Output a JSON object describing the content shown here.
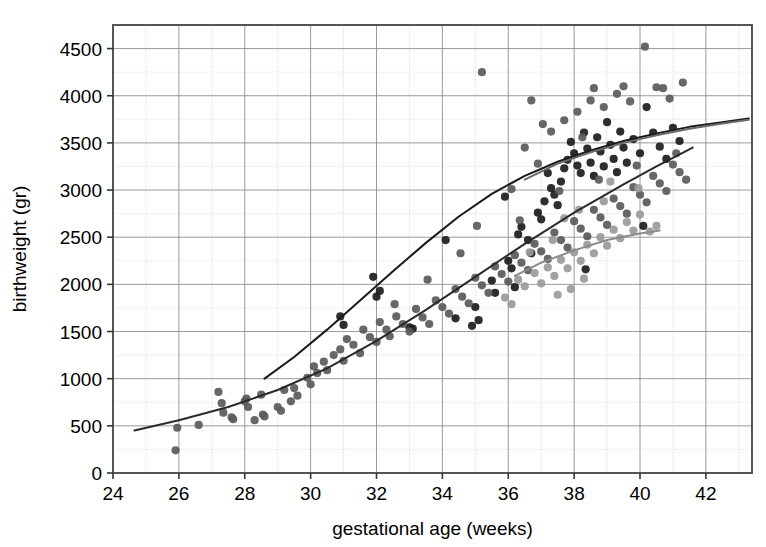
{
  "chart_data": {
    "type": "scatter",
    "title": "",
    "xlabel": "gestational age (weeks)",
    "ylabel": "birthweight (gr)",
    "xlim": [
      24,
      43.4
    ],
    "ylim": [
      0,
      4750
    ],
    "xticks": [
      24,
      26,
      28,
      30,
      32,
      34,
      36,
      38,
      40,
      42
    ],
    "yticks": [
      0,
      500,
      1000,
      1500,
      2000,
      2500,
      3000,
      3500,
      4000,
      4500
    ],
    "x_minor_step": 1,
    "grid": true,
    "grid_color": "#8a8a8a",
    "legend": "none",
    "frame_color": "#555555",
    "series": [
      {
        "name": "dark-points",
        "color": "#1c1c1c",
        "marker": "circle",
        "points": [
          [
            31.9,
            2080
          ],
          [
            32.0,
            1870
          ],
          [
            32.1,
            1930
          ],
          [
            33.1,
            1530
          ],
          [
            33.0,
            1545
          ],
          [
            34.1,
            2470
          ],
          [
            34.9,
            1560
          ],
          [
            35.0,
            1760
          ],
          [
            35.1,
            1620
          ],
          [
            35.5,
            2040
          ],
          [
            35.6,
            1910
          ],
          [
            35.9,
            2930
          ],
          [
            36.0,
            2250
          ],
          [
            36.1,
            2170
          ],
          [
            36.3,
            2530
          ],
          [
            36.4,
            2610
          ],
          [
            36.6,
            2470
          ],
          [
            36.7,
            2330
          ],
          [
            36.9,
            2760
          ],
          [
            37.0,
            2690
          ],
          [
            37.1,
            2880
          ],
          [
            37.2,
            3180
          ],
          [
            37.3,
            3020
          ],
          [
            37.4,
            2950
          ],
          [
            37.5,
            2840
          ],
          [
            37.6,
            3090
          ],
          [
            37.7,
            3230
          ],
          [
            37.8,
            3320
          ],
          [
            37.9,
            3510
          ],
          [
            38.0,
            3390
          ],
          [
            38.1,
            3260
          ],
          [
            38.2,
            3180
          ],
          [
            38.3,
            3610
          ],
          [
            38.4,
            3440
          ],
          [
            38.5,
            3290
          ],
          [
            38.6,
            3150
          ],
          [
            38.7,
            3560
          ],
          [
            38.8,
            3410
          ],
          [
            38.9,
            3250
          ],
          [
            39.0,
            3720
          ],
          [
            39.1,
            3480
          ],
          [
            39.2,
            3330
          ],
          [
            39.3,
            3190
          ],
          [
            39.4,
            3620
          ],
          [
            39.5,
            3450
          ],
          [
            39.6,
            3290
          ],
          [
            39.8,
            3540
          ],
          [
            40.0,
            3390
          ],
          [
            40.2,
            3880
          ],
          [
            40.4,
            3610
          ],
          [
            40.6,
            3460
          ],
          [
            40.8,
            3330
          ],
          [
            41.0,
            3660
          ],
          [
            41.2,
            3520
          ],
          [
            30.9,
            1660
          ],
          [
            31.0,
            1570
          ],
          [
            34.4,
            1640
          ],
          [
            36.2,
            1970
          ],
          [
            38.35,
            2160
          ],
          [
            40.1,
            2620
          ]
        ]
      },
      {
        "name": "medium-gray-points",
        "color": "#5a5a5a",
        "marker": "circle",
        "points": [
          [
            25.9,
            240
          ],
          [
            25.95,
            480
          ],
          [
            26.6,
            510
          ],
          [
            27.2,
            860
          ],
          [
            27.3,
            740
          ],
          [
            27.35,
            640
          ],
          [
            27.6,
            590
          ],
          [
            27.65,
            570
          ],
          [
            28.0,
            760
          ],
          [
            28.05,
            790
          ],
          [
            28.1,
            700
          ],
          [
            28.3,
            560
          ],
          [
            28.5,
            830
          ],
          [
            28.55,
            620
          ],
          [
            28.6,
            600
          ],
          [
            29.0,
            700
          ],
          [
            29.1,
            660
          ],
          [
            29.2,
            880
          ],
          [
            29.4,
            760
          ],
          [
            29.5,
            900
          ],
          [
            29.6,
            820
          ],
          [
            29.9,
            1010
          ],
          [
            30.0,
            940
          ],
          [
            30.1,
            1130
          ],
          [
            30.2,
            1060
          ],
          [
            30.4,
            1180
          ],
          [
            30.5,
            1090
          ],
          [
            30.7,
            1250
          ],
          [
            30.9,
            1310
          ],
          [
            31.0,
            1190
          ],
          [
            31.1,
            1420
          ],
          [
            31.3,
            1360
          ],
          [
            31.5,
            1270
          ],
          [
            31.6,
            1520
          ],
          [
            31.8,
            1440
          ],
          [
            32.0,
            1390
          ],
          [
            32.1,
            1600
          ],
          [
            32.3,
            1520
          ],
          [
            32.4,
            1450
          ],
          [
            32.6,
            1660
          ],
          [
            32.8,
            1580
          ],
          [
            33.0,
            1500
          ],
          [
            33.2,
            1740
          ],
          [
            33.4,
            1650
          ],
          [
            33.6,
            1580
          ],
          [
            33.8,
            1830
          ],
          [
            34.0,
            1760
          ],
          [
            34.2,
            1690
          ],
          [
            34.4,
            1950
          ],
          [
            34.6,
            1870
          ],
          [
            34.8,
            1800
          ],
          [
            35.0,
            2070
          ],
          [
            35.2,
            1990
          ],
          [
            35.4,
            1910
          ],
          [
            35.6,
            2190
          ],
          [
            35.8,
            2110
          ],
          [
            36.0,
            2030
          ],
          [
            36.2,
            2310
          ],
          [
            36.4,
            2230
          ],
          [
            36.6,
            2150
          ],
          [
            36.8,
            2430
          ],
          [
            37.0,
            2350
          ],
          [
            37.2,
            2270
          ],
          [
            37.4,
            2550
          ],
          [
            37.6,
            2470
          ],
          [
            37.8,
            2390
          ],
          [
            38.0,
            2670
          ],
          [
            38.2,
            2590
          ],
          [
            38.4,
            2510
          ],
          [
            38.6,
            2790
          ],
          [
            38.8,
            2710
          ],
          [
            39.0,
            2630
          ],
          [
            39.2,
            2910
          ],
          [
            39.4,
            2830
          ],
          [
            39.6,
            2750
          ],
          [
            39.8,
            3030
          ],
          [
            40.0,
            2950
          ],
          [
            40.2,
            2870
          ],
          [
            40.4,
            3150
          ],
          [
            40.6,
            3070
          ],
          [
            40.8,
            2990
          ],
          [
            41.0,
            3270
          ],
          [
            41.2,
            3190
          ],
          [
            41.4,
            3110
          ],
          [
            36.1,
            3010
          ],
          [
            36.5,
            3450
          ],
          [
            36.9,
            3280
          ],
          [
            37.3,
            3620
          ],
          [
            37.7,
            3740
          ],
          [
            38.1,
            3830
          ],
          [
            38.5,
            3950
          ],
          [
            38.9,
            3880
          ],
          [
            39.3,
            4020
          ],
          [
            39.7,
            3940
          ],
          [
            40.15,
            4520
          ],
          [
            40.5,
            4090
          ],
          [
            40.9,
            3970
          ],
          [
            41.3,
            4140
          ],
          [
            35.2,
            4250
          ],
          [
            36.7,
            3950
          ],
          [
            38.6,
            4080
          ],
          [
            39.5,
            4100
          ],
          [
            40.7,
            4080
          ],
          [
            37.05,
            3700
          ],
          [
            38.25,
            3560
          ],
          [
            36.35,
            2680
          ],
          [
            37.55,
            2990
          ],
          [
            38.75,
            3110
          ],
          [
            39.9,
            3260
          ],
          [
            41.1,
            3390
          ],
          [
            35.05,
            2620
          ],
          [
            34.55,
            2330
          ],
          [
            33.55,
            2050
          ],
          [
            32.55,
            1790
          ]
        ]
      },
      {
        "name": "light-gray-points",
        "color": "#9a9a9a",
        "marker": "circle",
        "points": [
          [
            36.3,
            2050
          ],
          [
            36.5,
            1980
          ],
          [
            36.8,
            2120
          ],
          [
            37.0,
            2010
          ],
          [
            37.2,
            2180
          ],
          [
            37.4,
            2090
          ],
          [
            37.5,
            1890
          ],
          [
            37.6,
            2260
          ],
          [
            37.8,
            2170
          ],
          [
            37.9,
            1950
          ],
          [
            38.0,
            2340
          ],
          [
            38.2,
            2250
          ],
          [
            38.3,
            2060
          ],
          [
            38.4,
            2420
          ],
          [
            38.6,
            2330
          ],
          [
            38.8,
            2500
          ],
          [
            39.0,
            2410
          ],
          [
            39.2,
            2580
          ],
          [
            39.4,
            2490
          ],
          [
            39.6,
            2660
          ],
          [
            39.8,
            2570
          ],
          [
            40.0,
            2740
          ],
          [
            35.9,
            1860
          ],
          [
            36.1,
            1790
          ],
          [
            37.7,
            2700
          ],
          [
            38.9,
            2880
          ],
          [
            39.1,
            3090
          ],
          [
            40.3,
            2560
          ],
          [
            40.5,
            2620
          ],
          [
            37.35,
            2470
          ],
          [
            38.15,
            2790
          ],
          [
            36.65,
            2340
          ],
          [
            39.95,
            3020
          ]
        ]
      }
    ],
    "curves": [
      {
        "name": "upper-curve-dark",
        "color": "#1a1a1a",
        "x_start": 28.6,
        "x_end": 43.3,
        "points": [
          [
            28.6,
            1000
          ],
          [
            29.5,
            1230
          ],
          [
            30.5,
            1520
          ],
          [
            31.5,
            1830
          ],
          [
            32.5,
            2140
          ],
          [
            33.5,
            2440
          ],
          [
            34.5,
            2720
          ],
          [
            35.5,
            2960
          ],
          [
            36.5,
            3150
          ],
          [
            37.5,
            3300
          ],
          [
            38.5,
            3420
          ],
          [
            39.5,
            3520
          ],
          [
            40.5,
            3600
          ],
          [
            41.5,
            3670
          ],
          [
            42.5,
            3720
          ],
          [
            43.3,
            3760
          ]
        ]
      },
      {
        "name": "upper-curve-gray",
        "color": "#6a6a6a",
        "x_start": 36.5,
        "x_end": 43.3,
        "points": [
          [
            36.5,
            3110
          ],
          [
            37.5,
            3280
          ],
          [
            38.5,
            3400
          ],
          [
            39.5,
            3500
          ],
          [
            40.5,
            3580
          ],
          [
            41.5,
            3650
          ],
          [
            42.5,
            3705
          ],
          [
            43.3,
            3745
          ]
        ]
      },
      {
        "name": "lower-curve-dark",
        "color": "#2a2a2a",
        "x_start": 24.65,
        "x_end": 41.6,
        "points": [
          [
            24.65,
            450
          ],
          [
            26,
            560
          ],
          [
            27.5,
            700
          ],
          [
            29,
            880
          ],
          [
            30.5,
            1110
          ],
          [
            32,
            1400
          ],
          [
            33.5,
            1730
          ],
          [
            35,
            2080
          ],
          [
            36.5,
            2430
          ],
          [
            38,
            2760
          ],
          [
            39.5,
            3060
          ],
          [
            40.5,
            3250
          ],
          [
            41.6,
            3450
          ]
        ]
      },
      {
        "name": "lower-curve-gray",
        "color": "#8a8a8a",
        "x_start": 36.2,
        "x_end": 40.6,
        "points": [
          [
            36.2,
            2090
          ],
          [
            37,
            2230
          ],
          [
            38,
            2360
          ],
          [
            39,
            2470
          ],
          [
            40,
            2540
          ],
          [
            40.6,
            2570
          ]
        ]
      }
    ]
  }
}
